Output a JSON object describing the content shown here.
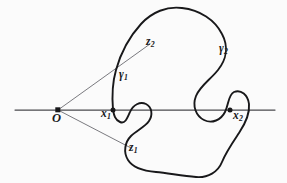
{
  "figure": {
    "kind": "mathematical-diagram",
    "background_color": "#fbfbfb",
    "ink_color": "#18181a",
    "thin_line_color": "#6b6b70",
    "axis_color": "#4a4a4e",
    "width": 287,
    "height": 183
  },
  "labels": {
    "origin": {
      "base": "O",
      "sub": "",
      "x": 52,
      "y": 112
    },
    "x1": {
      "base": "x",
      "sub": "1",
      "x": 101,
      "y": 108
    },
    "x2": {
      "base": "x",
      "sub": "2",
      "x": 233,
      "y": 110
    },
    "z1": {
      "base": "z",
      "sub": "1",
      "x": 129,
      "y": 142
    },
    "z2": {
      "base": "z",
      "sub": "2",
      "x": 146,
      "y": 36
    },
    "gamma1": {
      "base": "γ",
      "sub": "1",
      "x": 119,
      "y": 69
    },
    "gamma2": {
      "base": "γ",
      "sub": "2",
      "x": 219,
      "y": 43
    }
  },
  "points": {
    "origin": {
      "x": 58,
      "y": 110,
      "marker": "filled-square-dot"
    },
    "x1": {
      "x": 113,
      "y": 110,
      "marker": "filled-dot"
    },
    "x2": {
      "x": 230,
      "y": 110,
      "marker": "filled-dot"
    }
  },
  "axis": {
    "name": "real-axis",
    "x_start": 15,
    "x_end": 275,
    "y": 110
  },
  "rays": [
    {
      "name": "ray-origin-to-z2",
      "from": [
        58,
        110
      ],
      "to": [
        150,
        44
      ]
    },
    {
      "name": "ray-origin-to-z1",
      "from": [
        58,
        110
      ],
      "to": [
        131,
        148
      ]
    }
  ],
  "curve": {
    "name": "closed-curve-gamma",
    "path": "M 113 110 C 112 98 112 84 116 70 C 121 52 130 36 141 24 C 152 12 167 6 182 8 C 200 10 215 20 222 34 C 229 47 226 60 218 70 C 210 80 200 86 196 96 C 192 106 196 116 204 120 C 212 124 221 120 225 112 C 229 104 228 95 234 92 C 241 89 248 95 249 104 C 250 114 245 124 239 133 C 233 142 226 152 222 162 C 218 172 208 178 196 177 C 182 176 168 173 156 172 C 144 171 133 168 128 160 C 123 152 125 142 131 136 C 137 130 145 127 149 121 C 153 115 152 107 146 104 C 140 101 133 105 130 112 C 127 119 125 124 120 122 C 115 120 114 115 113 110 Z"
  }
}
